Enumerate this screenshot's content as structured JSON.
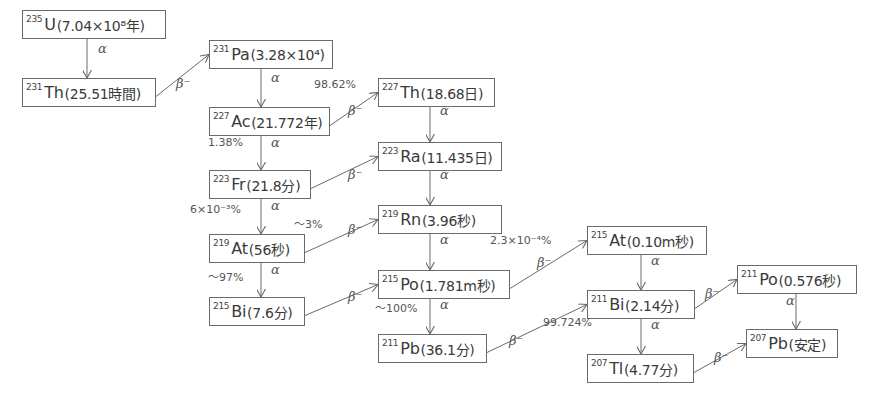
{
  "diagram": {
    "title": "",
    "nodes": [
      {
        "id": "U235",
        "mass": "235",
        "symbol": "U",
        "half_life": "(7.04×10⁸年)",
        "x": 22,
        "y": 10,
        "w": 144
      },
      {
        "id": "Th231",
        "mass": "231",
        "symbol": "Th",
        "half_life": "(25.51時間)",
        "x": 22,
        "y": 78,
        "w": 134
      },
      {
        "id": "Pa231",
        "mass": "231",
        "symbol": "Pa",
        "half_life": "(3.28×10⁴)",
        "x": 209,
        "y": 40,
        "w": 124
      },
      {
        "id": "Ac227",
        "mass": "227",
        "symbol": "Ac",
        "half_life": "(21.772年)",
        "x": 209,
        "y": 107,
        "w": 121
      },
      {
        "id": "Th227",
        "mass": "227",
        "symbol": "Th",
        "half_life": "(18.68日)",
        "x": 378,
        "y": 78,
        "w": 117
      },
      {
        "id": "Fr223",
        "mass": "223",
        "symbol": "Fr",
        "half_life": "(21.8分)",
        "x": 209,
        "y": 170,
        "w": 102
      },
      {
        "id": "Ra223",
        "mass": "223",
        "symbol": "Ra",
        "half_life": "(11.435日)",
        "x": 378,
        "y": 142,
        "w": 124
      },
      {
        "id": "At219",
        "mass": "219",
        "symbol": "At",
        "half_life": "(56秒)",
        "x": 209,
        "y": 234,
        "w": 96
      },
      {
        "id": "Rn219",
        "mass": "219",
        "symbol": "Rn",
        "half_life": "(3.96秒)",
        "x": 378,
        "y": 205,
        "w": 124
      },
      {
        "id": "Bi215",
        "mass": "215",
        "symbol": "Bi",
        "half_life": "(7.6分)",
        "x": 209,
        "y": 297,
        "w": 96
      },
      {
        "id": "Po215",
        "mass": "215",
        "symbol": "Po",
        "half_life": "(1.781m秒)",
        "x": 378,
        "y": 270,
        "w": 132
      },
      {
        "id": "Pb211",
        "mass": "211",
        "symbol": "Pb",
        "half_life": "(36.1分)",
        "x": 378,
        "y": 334,
        "w": 109
      },
      {
        "id": "At215",
        "mass": "215",
        "symbol": "At",
        "half_life": "(0.10m秒)",
        "x": 587,
        "y": 226,
        "w": 120
      },
      {
        "id": "Bi211",
        "mass": "211",
        "symbol": "Bi",
        "half_life": "(2.14分)",
        "x": 587,
        "y": 290,
        "w": 108
      },
      {
        "id": "Tl207",
        "mass": "207",
        "symbol": "Tl",
        "half_life": "(4.77分)",
        "x": 587,
        "y": 354,
        "w": 107
      },
      {
        "id": "Po211",
        "mass": "211",
        "symbol": "Po",
        "half_life": "(0.576秒)",
        "x": 737,
        "y": 265,
        "w": 120
      },
      {
        "id": "Pb207",
        "mass": "207",
        "symbol": "Pb",
        "half_life": "(安定)",
        "x": 746,
        "y": 329,
        "w": 92
      }
    ],
    "edges": [
      {
        "from": "U235",
        "to": "Th231",
        "mode": "α",
        "branch": ""
      },
      {
        "from": "Th231",
        "to": "Pa231",
        "mode": "β⁻",
        "branch": ""
      },
      {
        "from": "Pa231",
        "to": "Ac227",
        "mode": "α",
        "branch": ""
      },
      {
        "from": "Ac227",
        "to": "Th227",
        "mode": "β⁻",
        "branch": "98.62%"
      },
      {
        "from": "Ac227",
        "to": "Fr223",
        "mode": "α",
        "branch": "1.38%"
      },
      {
        "from": "Th227",
        "to": "Ra223",
        "mode": "α",
        "branch": ""
      },
      {
        "from": "Fr223",
        "to": "Ra223",
        "mode": "β⁻",
        "branch": ""
      },
      {
        "from": "Fr223",
        "to": "At219",
        "mode": "α",
        "branch": "6×10⁻³%"
      },
      {
        "from": "Ra223",
        "to": "Rn219",
        "mode": "α",
        "branch": ""
      },
      {
        "from": "At219",
        "to": "Rn219",
        "mode": "β⁻",
        "branch": "～3%"
      },
      {
        "from": "At219",
        "to": "Bi215",
        "mode": "α",
        "branch": "～97%"
      },
      {
        "from": "Rn219",
        "to": "Po215",
        "mode": "α",
        "branch": ""
      },
      {
        "from": "Bi215",
        "to": "Po215",
        "mode": "β⁻",
        "branch": ""
      },
      {
        "from": "Po215",
        "to": "At215",
        "mode": "β⁻",
        "branch": "2.3×10⁻⁴%"
      },
      {
        "from": "Po215",
        "to": "Pb211",
        "mode": "α",
        "branch": "～100%"
      },
      {
        "from": "At215",
        "to": "Bi211",
        "mode": "α",
        "branch": ""
      },
      {
        "from": "Pb211",
        "to": "Bi211",
        "mode": "β⁻",
        "branch": ""
      },
      {
        "from": "Bi211",
        "to": "Po211",
        "mode": "β⁻",
        "branch": ""
      },
      {
        "from": "Bi211",
        "to": "Tl207",
        "mode": "α",
        "branch": "99.724%"
      },
      {
        "from": "Po211",
        "to": "Pb207",
        "mode": "α",
        "branch": ""
      },
      {
        "from": "Tl207",
        "to": "Pb207",
        "mode": "β⁻",
        "branch": ""
      }
    ]
  },
  "labels": {
    "greek": [
      {
        "text": "α",
        "x": 98,
        "y": 51
      },
      {
        "text": "β⁻",
        "x": 176,
        "y": 86
      },
      {
        "text": "α",
        "x": 271,
        "y": 80
      },
      {
        "text": "β⁻",
        "x": 348,
        "y": 113
      },
      {
        "text": "α",
        "x": 271,
        "y": 145
      },
      {
        "text": "α",
        "x": 440,
        "y": 113
      },
      {
        "text": "β⁻",
        "x": 348,
        "y": 177
      },
      {
        "text": "α",
        "x": 271,
        "y": 208
      },
      {
        "text": "α",
        "x": 440,
        "y": 177
      },
      {
        "text": "β⁻",
        "x": 348,
        "y": 232
      },
      {
        "text": "α",
        "x": 271,
        "y": 272
      },
      {
        "text": "α",
        "x": 440,
        "y": 242
      },
      {
        "text": "β⁻",
        "x": 348,
        "y": 299
      },
      {
        "text": "β⁻",
        "x": 537,
        "y": 265
      },
      {
        "text": "α",
        "x": 440,
        "y": 307
      },
      {
        "text": "α",
        "x": 651,
        "y": 263
      },
      {
        "text": "β⁻",
        "x": 509,
        "y": 343
      },
      {
        "text": "β⁻",
        "x": 705,
        "y": 296
      },
      {
        "text": "α",
        "x": 651,
        "y": 327
      },
      {
        "text": "α",
        "x": 786,
        "y": 303
      },
      {
        "text": "β⁻",
        "x": 714,
        "y": 360
      }
    ],
    "branch": [
      {
        "text": "98.62%",
        "x": 314,
        "y": 88
      },
      {
        "text": "1.38%",
        "x": 208,
        "y": 146
      },
      {
        "text": "6×10⁻³%",
        "x": 190,
        "y": 213
      },
      {
        "text": "～3%",
        "x": 294,
        "y": 225
      },
      {
        "text": "～97%",
        "x": 208,
        "y": 278
      },
      {
        "text": "2.3×10⁻⁴%",
        "x": 490,
        "y": 244
      },
      {
        "text": "～100%",
        "x": 375,
        "y": 309
      },
      {
        "text": "99.724%",
        "x": 543,
        "y": 326
      }
    ]
  }
}
